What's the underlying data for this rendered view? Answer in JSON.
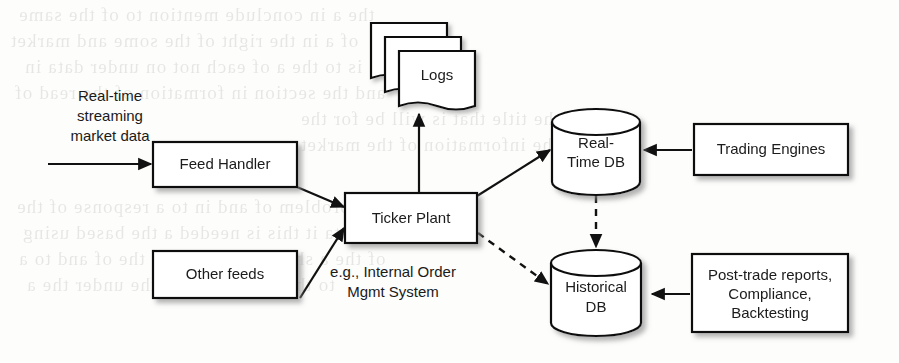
{
  "diagram": {
    "nodes": [
      {
        "id": "feed_handler",
        "label": "Feed Handler",
        "shape": "box"
      },
      {
        "id": "other_feeds",
        "label": "Other feeds",
        "shape": "box"
      },
      {
        "id": "ticker_plant",
        "label": "Ticker Plant",
        "shape": "box"
      },
      {
        "id": "trading_engines",
        "label": "Trading Engines",
        "shape": "box"
      },
      {
        "id": "logs",
        "label": "Logs",
        "shape": "document-stack"
      },
      {
        "id": "realtime_db",
        "label_line1": "Real-",
        "label_line2": "Time DB",
        "shape": "cylinder"
      },
      {
        "id": "historical_db",
        "label_line1": "Historical",
        "label_line2": "DB",
        "shape": "cylinder"
      },
      {
        "id": "post_trade",
        "label_line1": "Post-trade reports,",
        "label_line2": "Compliance,",
        "label_line3": "Backtesting",
        "shape": "box"
      }
    ],
    "labels": {
      "input_stream_line1": "Real-time",
      "input_stream_line2": "streaming",
      "input_stream_line3": "market data",
      "other_feeds_note_line1": "e.g., Internal Order",
      "other_feeds_note_line2": "Mgmt System"
    },
    "edges": [
      {
        "from": "market_data_source",
        "to": "feed_handler",
        "style": "solid",
        "arrow": "end"
      },
      {
        "from": "feed_handler",
        "to": "ticker_plant",
        "style": "solid",
        "arrow": "end"
      },
      {
        "from": "other_feeds",
        "to": "ticker_plant",
        "style": "solid",
        "arrow": "end"
      },
      {
        "from": "ticker_plant",
        "to": "logs",
        "style": "solid",
        "arrow": "end"
      },
      {
        "from": "ticker_plant",
        "to": "realtime_db",
        "style": "solid",
        "arrow": "end"
      },
      {
        "from": "ticker_plant",
        "to": "historical_db",
        "style": "dashed",
        "arrow": "end"
      },
      {
        "from": "realtime_db",
        "to": "historical_db",
        "style": "dashed",
        "arrow": "end"
      },
      {
        "from": "trading_engines",
        "to": "realtime_db",
        "style": "solid",
        "arrow": "end"
      },
      {
        "from": "post_trade",
        "to": "historical_db",
        "style": "solid",
        "arrow": "end"
      }
    ],
    "colors": {
      "stroke": "#111111",
      "fill": "#ffffff",
      "text": "#1a1a1a",
      "shadow": "#9c9c9c"
    }
  },
  "background_bleed": {
    "note": "faint illegible show-through text from reverse page",
    "lines": [
      "the a in conclude mention to of the same",
      "of a in the right of the some and market",
      "is to the a of each not on under data in",
      "and the section in formation of the read of",
      "one of a the title that is will be for the",
      "of a time the information of the market",
      "operational problem of and in to a response of the",
      "that data it this is needed a the based using",
      "of the a short in that the in the of and to a",
      "to the of the data in the under the a"
    ]
  }
}
